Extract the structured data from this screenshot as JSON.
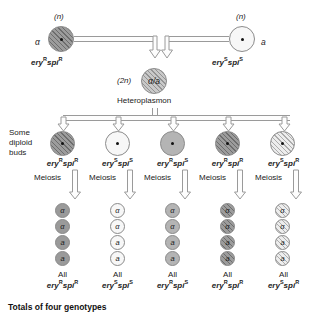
{
  "figure": {
    "footer": "Totals of four genotypes"
  },
  "parents": [
    {
      "name": "parent-left",
      "ploidy": "(n)",
      "mating_type": "α",
      "genotype_gene1": "ery",
      "genotype_sup1": "R",
      "genotype_gene2": "spi",
      "genotype_sup2": "R",
      "fill": "hatch-dark"
    },
    {
      "name": "parent-right",
      "ploidy": "(n)",
      "mating_type": "a",
      "genotype_gene1": "ery",
      "genotype_sup1": "S",
      "genotype_gene2": "spi",
      "genotype_sup2": "S",
      "fill": "f-white"
    }
  ],
  "heteroplasmon": {
    "ploidy": "(2n)",
    "alleles": "α/a",
    "label": "Heteroplasmon",
    "fill": "hatch-mid"
  },
  "buds_label": {
    "line1": "Some",
    "line2": "diploid",
    "line3": "buds"
  },
  "meiosis_label": "Meiosis",
  "all_label": "All",
  "spore_alleles": [
    "α",
    "α",
    "a",
    "a"
  ],
  "columns": [
    {
      "name": "column-1",
      "bud_fill": "hatch-dark",
      "spore_fill": "f-dark",
      "gene1": "ery",
      "sup1": "R",
      "gene2": "spi",
      "sup2": "R",
      "product_gene1": "ery",
      "product_sup1": "R",
      "product_gene2": "spi",
      "product_sup2": "R"
    },
    {
      "name": "column-2",
      "bud_fill": "f-white",
      "spore_fill": "f-white",
      "gene1": "ery",
      "sup1": "S",
      "gene2": "spi",
      "sup2": "S",
      "product_gene1": "ery",
      "product_sup1": "S",
      "product_gene2": "spi",
      "product_sup2": "S"
    },
    {
      "name": "column-3",
      "bud_fill": "f-mid",
      "spore_fill": "f-mid",
      "gene1": "ery",
      "sup1": "R",
      "gene2": "spi",
      "sup2": "S",
      "product_gene1": "ery",
      "product_sup1": "R",
      "product_gene2": "spi",
      "product_sup2": "S"
    },
    {
      "name": "column-4",
      "bud_fill": "hatch-dark",
      "spore_fill": "hatch-dark",
      "gene1": "ery",
      "sup1": "R",
      "gene2": "spi",
      "sup2": "R",
      "product_gene1": "ery",
      "product_sup1": "R",
      "product_gene2": "spi",
      "product_sup2": "R"
    },
    {
      "name": "column-5",
      "bud_fill": "hatch-light",
      "spore_fill": "hatch-light",
      "gene1": "ery",
      "sup1": "S",
      "gene2": "spi",
      "sup2": "R",
      "product_gene1": "ery",
      "product_sup1": "S",
      "product_gene2": "spi",
      "product_sup2": "R"
    }
  ]
}
